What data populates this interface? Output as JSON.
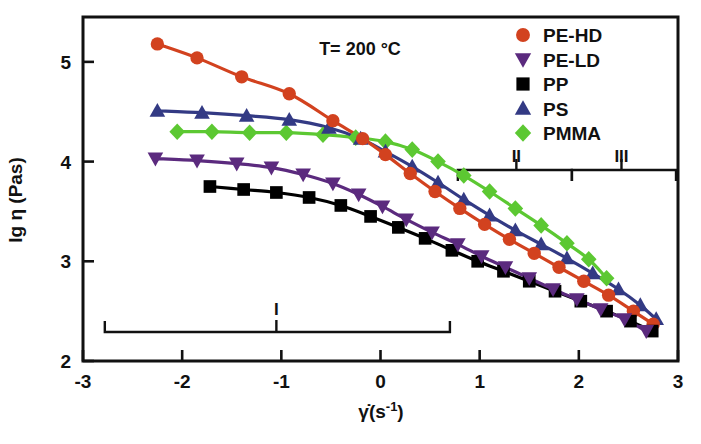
{
  "chart_data": {
    "type": "line",
    "title": "",
    "annotation": "T= 200 °C",
    "xlabel": "γ̇(s⁻¹)",
    "ylabel": "lg η (Pas)",
    "xlim": [
      -3,
      3
    ],
    "ylim": [
      2,
      5.45
    ],
    "xticks": [
      -3,
      -2,
      -1,
      0,
      1,
      2,
      3
    ],
    "xticklabels": [
      "-3",
      "-2",
      "-1",
      "0",
      "1",
      "2",
      "3"
    ],
    "yticks": [
      2,
      3,
      4,
      5
    ],
    "yticklabels": [
      "2",
      "3",
      "4",
      "5"
    ],
    "grid": false,
    "legend_position": "top-right",
    "series": [
      {
        "name": "PE-HD",
        "color": "#d2421f",
        "marker": "circle",
        "x": [
          -2.25,
          -1.85,
          -1.4,
          -0.92,
          -0.48,
          -0.18,
          0.05,
          0.3,
          0.55,
          0.8,
          1.05,
          1.3,
          1.55,
          1.8,
          2.05,
          2.3,
          2.55,
          2.75
        ],
        "y": [
          5.18,
          5.04,
          4.85,
          4.68,
          4.41,
          4.23,
          4.07,
          3.88,
          3.7,
          3.53,
          3.37,
          3.22,
          3.08,
          2.94,
          2.8,
          2.66,
          2.5,
          2.37
        ]
      },
      {
        "name": "PE-LD",
        "color": "#5b2a7e",
        "marker": "triangle-down",
        "x": [
          -2.27,
          -1.85,
          -1.45,
          -1.1,
          -0.78,
          -0.48,
          -0.22,
          0.02,
          0.26,
          0.52,
          0.78,
          1.02,
          1.26,
          1.5,
          1.74,
          1.98,
          2.22,
          2.46,
          2.68
        ],
        "y": [
          4.03,
          4.01,
          3.98,
          3.94,
          3.87,
          3.78,
          3.67,
          3.55,
          3.42,
          3.29,
          3.17,
          3.05,
          2.94,
          2.83,
          2.72,
          2.62,
          2.52,
          2.42,
          2.3
        ]
      },
      {
        "name": "PP",
        "color": "#000000",
        "marker": "square",
        "x": [
          -1.72,
          -1.38,
          -1.05,
          -0.72,
          -0.4,
          -0.1,
          0.18,
          0.45,
          0.72,
          0.98,
          1.24,
          1.5,
          1.76,
          2.02,
          2.28,
          2.52,
          2.74
        ],
        "y": [
          3.75,
          3.72,
          3.69,
          3.64,
          3.56,
          3.45,
          3.34,
          3.23,
          3.11,
          3.0,
          2.9,
          2.8,
          2.7,
          2.6,
          2.5,
          2.4,
          2.3
        ]
      },
      {
        "name": "PS",
        "color": "#333a84",
        "marker": "triangle-up",
        "x": [
          -2.25,
          -1.8,
          -1.35,
          -0.92,
          -0.52,
          -0.2,
          0.05,
          0.32,
          0.58,
          0.84,
          1.1,
          1.36,
          1.62,
          1.88,
          2.14,
          2.4,
          2.62,
          2.78
        ],
        "y": [
          4.51,
          4.49,
          4.46,
          4.42,
          4.34,
          4.23,
          4.1,
          3.95,
          3.79,
          3.62,
          3.46,
          3.31,
          3.17,
          3.03,
          2.88,
          2.72,
          2.56,
          2.42
        ]
      },
      {
        "name": "PMMA",
        "color": "#5cc832",
        "marker": "diamond",
        "x": [
          -2.05,
          -1.7,
          -1.32,
          -0.95,
          -0.58,
          -0.25,
          0.05,
          0.32,
          0.58,
          0.84,
          1.1,
          1.36,
          1.62,
          1.88,
          2.1,
          2.28
        ],
        "y": [
          4.3,
          4.3,
          4.29,
          4.29,
          4.27,
          4.24,
          4.2,
          4.12,
          4.0,
          3.86,
          3.7,
          3.53,
          3.36,
          3.18,
          3.02,
          2.83
        ]
      }
    ],
    "regions": [
      {
        "label": "I",
        "x_start": -2.78,
        "x_end": 0.7,
        "placement": "bottom",
        "label_x": -1.05
      },
      {
        "label": "II",
        "x_start": 0.78,
        "x_end": 1.93,
        "placement": "top",
        "label_x": 1.37
      },
      {
        "label": "III",
        "x_start": 1.93,
        "x_end": 2.98,
        "placement": "top",
        "label_x": 2.43
      }
    ]
  },
  "legend": {
    "items": [
      {
        "label": "PE-HD",
        "color": "#d2421f",
        "marker": "circle"
      },
      {
        "label": "PE-LD",
        "color": "#5b2a7e",
        "marker": "triangle-down"
      },
      {
        "label": "PP",
        "color": "#000000",
        "marker": "square"
      },
      {
        "label": "PS",
        "color": "#333a84",
        "marker": "triangle-up"
      },
      {
        "label": "PMMA",
        "color": "#5cc832",
        "marker": "diamond"
      }
    ]
  },
  "axis_text": {
    "ylabel": "lg η (Pas)",
    "xlabel_gamma": "γ",
    "xlabel_rest": "(s",
    "xlabel_exp": "-1",
    "xlabel_close": ")"
  }
}
